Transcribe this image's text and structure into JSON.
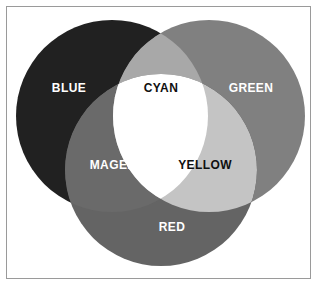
{
  "figure": {
    "background_color": "#ffffff",
    "frame_color": "#9a9a9a",
    "center_color": "#ffffff",
    "center_label": ""
  },
  "geometry": {
    "radius": 96,
    "blue_center": {
      "x": 112,
      "y": 116
    },
    "green_center": {
      "x": 209,
      "y": 116
    },
    "red_center": {
      "x": 161,
      "y": 170
    }
  },
  "regions": {
    "blue": {
      "label": "BLUE",
      "fill": "#212121",
      "text_color": "#ffffff",
      "label_x": 69,
      "label_y": 89
    },
    "green": {
      "label": "GREEN",
      "fill": "#808080",
      "text_color": "#ffffff",
      "label_x": 251,
      "label_y": 89
    },
    "red": {
      "label": "RED",
      "fill": "#646464",
      "text_color": "#ffffff",
      "label_x": 172,
      "label_y": 228
    },
    "cyan": {
      "label": "CYAN",
      "fill": "#a8a8a8",
      "text_color": "#101010",
      "label_x": 161,
      "label_y": 89
    },
    "magenta": {
      "label": "MAGENTA",
      "fill": "#6a6a6a",
      "text_color": "#ffffff",
      "label_x": 121,
      "label_y": 166
    },
    "yellow": {
      "label": "YELLOW",
      "fill": "#c4c4c4",
      "text_color": "#101010",
      "label_x": 205,
      "label_y": 166
    }
  }
}
